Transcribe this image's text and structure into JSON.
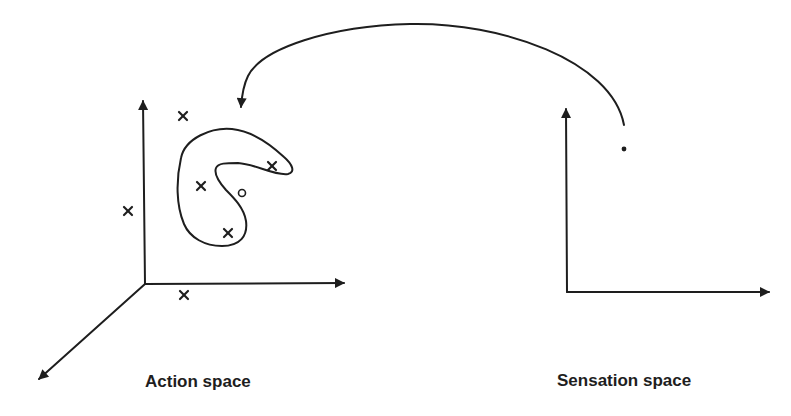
{
  "labels": {
    "action_space": "Action space",
    "sensation_space": "Sensation space"
  },
  "colors": {
    "ink": "#1e1e1e",
    "background": "#ffffff"
  },
  "action_space": {
    "axes": {
      "origin": [
        145,
        284
      ],
      "vertical_end": [
        143,
        100
      ],
      "horizontal_end": [
        345,
        284
      ],
      "depth_end": [
        38,
        380
      ]
    },
    "points": [
      {
        "type": "cross",
        "x": 183,
        "y": 116,
        "inside_region": false
      },
      {
        "type": "cross",
        "x": 128,
        "y": 211,
        "inside_region": false
      },
      {
        "type": "cross",
        "x": 184,
        "y": 295,
        "inside_region": false
      },
      {
        "type": "cross",
        "x": 201,
        "y": 186,
        "inside_region": true
      },
      {
        "type": "cross",
        "x": 272,
        "y": 166,
        "inside_region": true
      },
      {
        "type": "cross",
        "x": 228,
        "y": 233,
        "inside_region": true
      },
      {
        "type": "circle",
        "x": 242,
        "y": 193,
        "inside_region": true
      }
    ],
    "region": "kidney-shaped closed contour enclosing three crosses and the circle"
  },
  "sensation_space": {
    "axes": {
      "origin": [
        567,
        292
      ],
      "vertical_end": [
        566,
        108
      ],
      "horizontal_end": [
        770,
        292
      ]
    },
    "point": {
      "type": "dot",
      "x": 624,
      "y": 149
    }
  },
  "mapping_arrow": {
    "from": "sensation_space.point",
    "to": "action_space.region",
    "start": [
      624,
      125
    ],
    "end": [
      240,
      108
    ]
  }
}
